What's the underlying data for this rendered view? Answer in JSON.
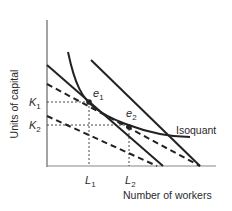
{
  "diagram": {
    "type": "isoquant-isocost",
    "y_axis_label": "Units of capital",
    "x_axis_label": "Number of workers",
    "curve_label": "Isoquant",
    "points": [
      {
        "label": "e",
        "sub": "1"
      },
      {
        "label": "e",
        "sub": "2"
      }
    ],
    "y_ticks": [
      {
        "label": "K",
        "sub": "1"
      },
      {
        "label": "K",
        "sub": "2"
      }
    ],
    "x_ticks": [
      {
        "label": "L",
        "sub": "1"
      },
      {
        "label": "L",
        "sub": "2"
      }
    ],
    "colors": {
      "line": "#222222",
      "axis": "#555555",
      "text": "#2a2a2a"
    }
  }
}
